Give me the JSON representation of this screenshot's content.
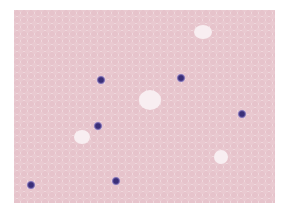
{
  "image": {
    "subject": "stained blood smear micrograph",
    "background_color": "#ffffff",
    "field_color": "#f4e6ea",
    "rbc_color": "#e6c3cb",
    "stained_cell_color": "#3a2f78",
    "stained_cells": [
      {
        "x": 101,
        "y": 80
      },
      {
        "x": 181,
        "y": 78
      },
      {
        "x": 98,
        "y": 126
      },
      {
        "x": 242,
        "y": 114
      },
      {
        "x": 31,
        "y": 185
      },
      {
        "x": 116,
        "y": 181
      }
    ]
  }
}
